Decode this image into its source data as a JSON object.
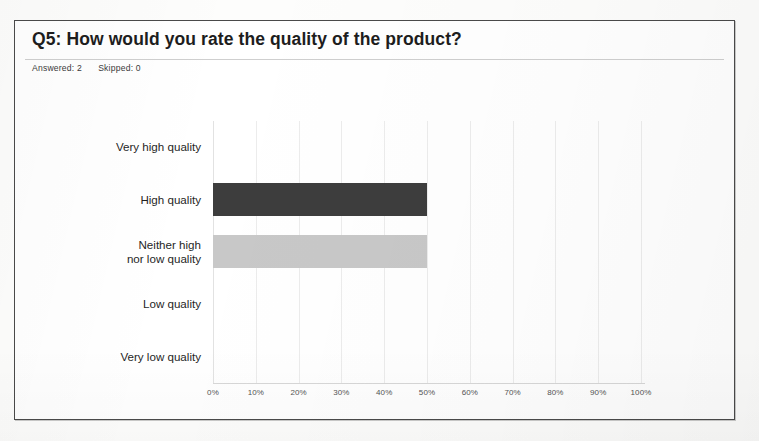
{
  "card": {
    "title": "Q5: How would you rate the quality of the product?",
    "answered_label": "Answered: 2",
    "skipped_label": "Skipped: 0"
  },
  "colors": {
    "bar_dark": "#3d3d3d",
    "bar_light": "#c8c8c8",
    "border": "#4a4a4a",
    "gridline": "#ececec",
    "text": "#1f1f1f"
  },
  "chart_data": {
    "type": "bar",
    "orientation": "horizontal",
    "title": "Q5: How would you rate the quality of the product?",
    "xlabel": "",
    "ylabel": "",
    "xlim": [
      0,
      100
    ],
    "grid": true,
    "legend": "none",
    "categories": [
      "Very high quality",
      "High quality",
      "Neither high nor low quality",
      "Low quality",
      "Very low quality"
    ],
    "category_lines": [
      [
        "Very high quality"
      ],
      [
        "High quality"
      ],
      [
        "Neither high",
        "nor low quality"
      ],
      [
        "Low quality"
      ],
      [
        "Very low quality"
      ]
    ],
    "values": [
      0,
      50,
      50,
      0,
      0
    ],
    "value_unit": "%",
    "bar_colors": [
      "#3d3d3d",
      "#3d3d3d",
      "#c8c8c8",
      "#c8c8c8",
      "#c8c8c8"
    ],
    "xticks": [
      0,
      10,
      20,
      30,
      40,
      50,
      60,
      70,
      80,
      90,
      100
    ],
    "xtick_labels": [
      "0%",
      "10%",
      "20%",
      "30%",
      "40%",
      "50%",
      "60%",
      "70%",
      "80%",
      "90%",
      "100%"
    ],
    "responses_answered": 2,
    "responses_skipped": 0
  }
}
